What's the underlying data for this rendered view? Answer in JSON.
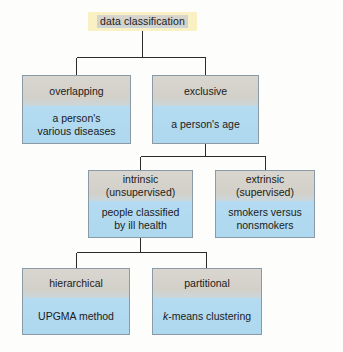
{
  "diagram": {
    "title": "data classification",
    "colors": {
      "background": "#fdfdfb",
      "root_fill": "#f9f0c4",
      "node_top_fill": "#d5d3cc",
      "node_bottom_fill": "#b1d9f0",
      "border": "#8a9aa6",
      "connector": "#2b2b2b",
      "text": "#1b1b1b"
    },
    "nodes": {
      "root": {
        "label": "data classification"
      },
      "overlapping": {
        "label": "overlapping",
        "example_line1": "a person's",
        "example_line2": "various diseases"
      },
      "exclusive": {
        "label": "exclusive",
        "example_line1": "a person's age",
        "example_line2": ""
      },
      "intrinsic": {
        "label_line1": "intrinsic",
        "label_line2": "(unsupervised)",
        "example_line1": "people classified",
        "example_line2": "by ill health"
      },
      "extrinsic": {
        "label_line1": "extrinsic",
        "label_line2": "(supervised)",
        "example_line1": "smokers versus",
        "example_line2": "nonsmokers"
      },
      "hierarchical": {
        "label": "hierarchical",
        "example_line1": "UPGMA method"
      },
      "partitional": {
        "label": "partitional",
        "example_italic": "k",
        "example_rest": "-means clustering"
      }
    }
  }
}
